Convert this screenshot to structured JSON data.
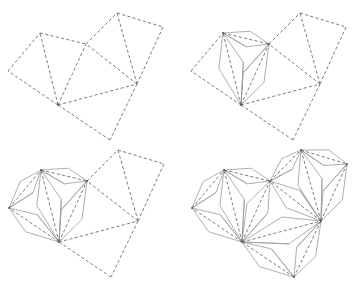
{
  "figure": {
    "colors": {
      "dashed": "#6e6e6e",
      "solid": "#9a9a9a",
      "background": "#ffffff"
    },
    "base_vertices": {
      "A": [
        8,
        71
      ],
      "B": [
        40,
        33
      ],
      "C": [
        86,
        44
      ],
      "D": [
        117,
        13
      ],
      "E": [
        163,
        27
      ],
      "F": [
        137,
        84
      ],
      "G": [
        58,
        105
      ],
      "H": [
        110,
        140
      ]
    },
    "triangles": [
      [
        "A",
        "B",
        "G"
      ],
      [
        "B",
        "C",
        "G"
      ],
      [
        "C",
        "F",
        "G"
      ],
      [
        "C",
        "D",
        "F"
      ],
      [
        "D",
        "E",
        "F"
      ],
      [
        "G",
        "F",
        "H"
      ]
    ],
    "kite_width": 0.17,
    "kite_position": 0.55,
    "panels": [
      {
        "name": "panel-1",
        "offset": [
          0,
          0
        ],
        "folded": []
      },
      {
        "name": "panel-2",
        "offset": [
          183,
          0
        ],
        "folded": [
          1
        ]
      },
      {
        "name": "panel-3",
        "offset": [
          1,
          137
        ],
        "folded": [
          0,
          1
        ]
      },
      {
        "name": "panel-4",
        "offset": [
          184,
          137
        ],
        "folded": [
          0,
          1,
          2,
          3,
          4,
          5
        ]
      }
    ]
  }
}
